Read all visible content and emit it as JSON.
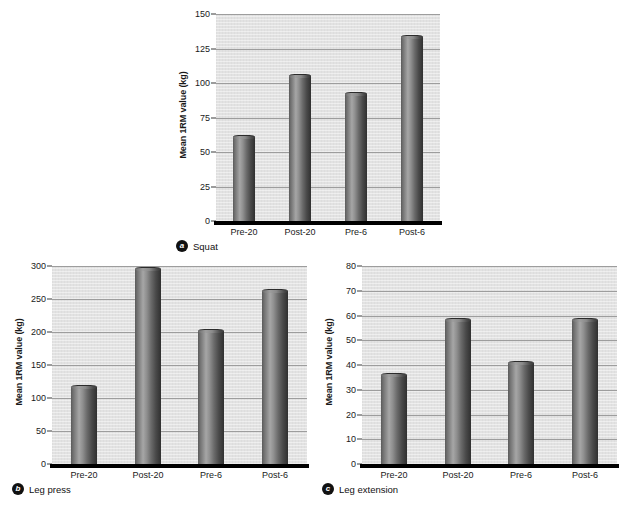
{
  "figure": {
    "background": "#ffffff",
    "bar_color_dark": "#3a3a3a",
    "bar_color_light": "#a6a6a6",
    "plot_background": "#e2e2e2",
    "gridline_color": "#9d9d9d"
  },
  "panels": [
    {
      "badge": "a",
      "caption": "Squat",
      "ylabel": "Mean 1RM value (kg)",
      "yticks": [
        "0",
        "25",
        "50",
        "75",
        "100",
        "125",
        "150"
      ],
      "xticks": [
        "Pre-20",
        "Post-20",
        "Pre-6",
        "Post-6"
      ]
    },
    {
      "badge": "b",
      "caption": "Leg press",
      "ylabel": "Mean 1RM value (kg)",
      "yticks": [
        "0",
        "50",
        "100",
        "150",
        "200",
        "250",
        "300"
      ],
      "xticks": [
        "Pre-20",
        "Post-20",
        "Pre-6",
        "Post-6"
      ]
    },
    {
      "badge": "c",
      "caption": "Leg extension",
      "ylabel": "Mean 1RM value (kg)",
      "yticks": [
        "0",
        "10",
        "20",
        "30",
        "40",
        "50",
        "60",
        "70",
        "80"
      ],
      "xticks": [
        "Pre-20",
        "Post-20",
        "Pre-6",
        "Post-6"
      ]
    }
  ],
  "chart_data": [
    {
      "type": "bar",
      "title": "Squat",
      "panel_label": "a",
      "xlabel": "",
      "ylabel": "Mean 1RM value (kg)",
      "categories": [
        "Pre-20",
        "Post-20",
        "Pre-6",
        "Post-6"
      ],
      "values": [
        61,
        105,
        92,
        133
      ],
      "ylim": [
        0,
        150
      ],
      "ytick_step": 25,
      "grid": true,
      "legend": "none"
    },
    {
      "type": "bar",
      "title": "Leg press",
      "panel_label": "b",
      "xlabel": "",
      "ylabel": "Mean 1RM value (kg)",
      "categories": [
        "Pre-20",
        "Post-20",
        "Pre-6",
        "Post-6"
      ],
      "values": [
        117,
        296,
        201,
        262
      ],
      "ylim": [
        0,
        300
      ],
      "ytick_step": 50,
      "grid": true,
      "legend": "none"
    },
    {
      "type": "bar",
      "title": "Leg extension",
      "panel_label": "c",
      "xlabel": "",
      "ylabel": "Mean 1RM value (kg)",
      "categories": [
        "Pre-20",
        "Post-20",
        "Pre-6",
        "Post-6"
      ],
      "values": [
        36,
        58,
        41,
        58
      ],
      "ylim": [
        0,
        80
      ],
      "ytick_step": 10,
      "grid": true,
      "legend": "none"
    }
  ]
}
